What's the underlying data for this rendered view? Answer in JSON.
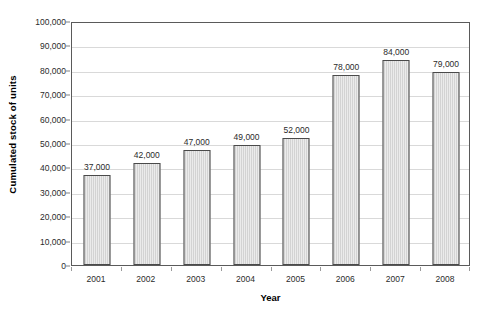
{
  "chart_data": {
    "type": "bar",
    "title": "",
    "xlabel": "Year",
    "ylabel": "Cumulated stock of units",
    "categories": [
      "2001",
      "2002",
      "2003",
      "2004",
      "2005",
      "2006",
      "2007",
      "2008"
    ],
    "values": [
      37000,
      42000,
      47000,
      49000,
      52000,
      78000,
      84000,
      79000
    ],
    "data_labels": [
      "37,000",
      "42,000",
      "47,000",
      "49,000",
      "52,000",
      "78,000",
      "84,000",
      "79,000"
    ],
    "ylim": [
      0,
      100000
    ],
    "ytick_values": [
      0,
      10000,
      20000,
      30000,
      40000,
      50000,
      60000,
      70000,
      80000,
      90000,
      100000
    ],
    "ytick_labels": [
      "0",
      "10,000",
      "20,000",
      "30,000",
      "40,000",
      "50,000",
      "60,000",
      "70,000",
      "80,000",
      "90,000",
      "100,000"
    ],
    "grid": true,
    "grid_axis": "y",
    "legend": false,
    "legend_position": "none",
    "series": [
      {
        "name": "Cumulated stock of units",
        "values": [
          37000,
          42000,
          47000,
          49000,
          52000,
          78000,
          84000,
          79000
        ]
      }
    ],
    "colors": {
      "bar_fill": "#d3d3d3",
      "bar_border": "#4a4a4a",
      "gridline": "#d9d9d9",
      "axis_frame": "#5a5a5a",
      "text": "#000000",
      "background": "#ffffff"
    }
  }
}
